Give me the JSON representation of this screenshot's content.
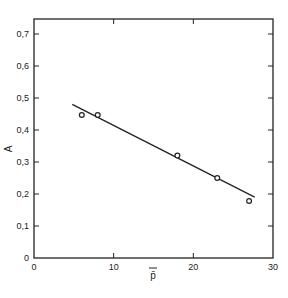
{
  "chart_data": {
    "type": "scatter",
    "title": "",
    "xlabel": "p̄",
    "ylabel": "A",
    "xlim": [
      0,
      30
    ],
    "ylim": [
      0,
      0.75
    ],
    "x_ticks": [
      "0",
      "10",
      "20",
      "30"
    ],
    "y_ticks": [
      "0",
      "0.1",
      "0.2",
      "0.3",
      "0.4",
      "0.5",
      "0.6",
      "0.7"
    ],
    "grid": false,
    "legend": null,
    "series": [
      {
        "name": "measured",
        "marker": "open-circle",
        "x": [
          6,
          8,
          18,
          23,
          27
        ],
        "y": [
          0.447,
          0.447,
          0.32,
          0.25,
          0.178
        ]
      },
      {
        "name": "fit",
        "style": "line",
        "x": [
          4.8,
          27.7
        ],
        "y": [
          0.48,
          0.19
        ]
      }
    ]
  },
  "axes": {
    "x_label": "p̄",
    "y_label": "A",
    "x_tick_labels": [
      "0",
      "10",
      "20",
      "30"
    ],
    "y_tick_labels": [
      "0",
      "0,1",
      "0,2",
      "0,3",
      "0,4",
      "0,5",
      "0,6",
      "0,7"
    ]
  },
  "colors": {
    "ink": "#222222",
    "background": "#ffffff"
  }
}
